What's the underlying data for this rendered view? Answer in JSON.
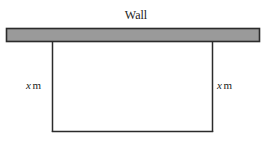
{
  "figure": {
    "title_label": "Wall",
    "wall": {
      "name": "wall-bar",
      "fill_color": "#9a9a9a",
      "stroke_color": "#2b2b2b",
      "x": 6,
      "y": 28,
      "width": 254,
      "height": 14
    },
    "enclosure": {
      "name": "fence-rectangle",
      "stroke_color": "#2b2b2b",
      "left_x": 52,
      "right_x": 213,
      "top_y": 41,
      "bottom_y": 132
    },
    "labels": [
      {
        "name": "left-side-length",
        "variable": "x",
        "unit": "m",
        "text": "x m"
      },
      {
        "name": "right-side-length",
        "variable": "x",
        "unit": "m",
        "text": "x m"
      }
    ],
    "background_color": "#ffffff"
  }
}
